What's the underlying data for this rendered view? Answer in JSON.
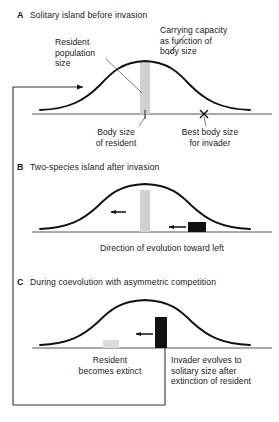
{
  "figure": {
    "type": "diagram",
    "panels": [
      {
        "id": "A",
        "letter": "A",
        "title": "Solitary island before invasion",
        "annotations": [
          {
            "name": "resident-population-size",
            "text": "Resident\npopulation\nsize"
          },
          {
            "name": "carrying-capacity",
            "text": "Carrying capacity\nas function of\nbody size"
          },
          {
            "name": "body-size-of-resident",
            "text": "Body size\nof resident"
          },
          {
            "name": "best-body-size-for-invader",
            "text": "Best body size\nfor invader"
          }
        ],
        "bars": [
          {
            "name": "resident-bar",
            "color": "#d0d0d0",
            "role": "resident"
          }
        ],
        "markers": [
          {
            "name": "resident-tick",
            "glyph": "tick"
          },
          {
            "name": "invader-optimum-x",
            "glyph": "x"
          }
        ]
      },
      {
        "id": "B",
        "letter": "B",
        "title": "Two-species island after invasion",
        "annotations": [
          {
            "name": "direction-of-evolution",
            "text": "Direction of evolution toward left"
          }
        ],
        "bars": [
          {
            "name": "resident-bar",
            "color": "#d0d0d0",
            "role": "resident"
          },
          {
            "name": "invader-bar",
            "color": "#111111",
            "role": "invader"
          }
        ],
        "markers": [
          {
            "name": "resident-shift-arrow",
            "glyph": "arrow-left"
          },
          {
            "name": "invader-shift-arrow",
            "glyph": "arrow-left"
          }
        ]
      },
      {
        "id": "C",
        "letter": "C",
        "title": "During coevolution with asymmetric competition",
        "annotations": [
          {
            "name": "resident-becomes-extinct",
            "text": "Resident\nbecomes extinct"
          },
          {
            "name": "invader-evolves-to-solitary-size",
            "text": "Invader evolves to\nsolitary size after\nextinction of resident"
          }
        ],
        "bars": [
          {
            "name": "resident-bar-faded",
            "color": "#dcdcdc",
            "role": "resident-extinct"
          },
          {
            "name": "invader-bar",
            "color": "#111111",
            "role": "invader"
          }
        ],
        "markers": [
          {
            "name": "invader-shift-arrow",
            "glyph": "arrow-left"
          }
        ]
      }
    ],
    "feedback_loop": {
      "name": "feedback-loop-arrow",
      "description": "Loop from panel C back up to panel A curve"
    },
    "colors": {
      "curve": "#111111",
      "axis": "#555555",
      "resident_bar": "#d0d0d0",
      "resident_bar_faded": "#dcdcdc",
      "invader_bar": "#111111",
      "frame": "#333333",
      "text": "#1a1a1a"
    }
  }
}
